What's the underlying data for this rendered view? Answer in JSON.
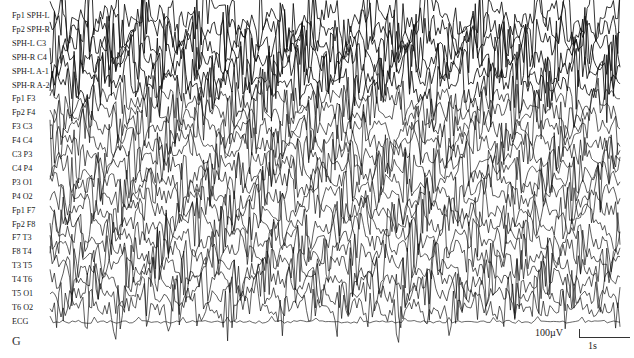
{
  "figure": {
    "panel_letter": "G",
    "channels": [
      "Fp1 SPH-L",
      "Fp2 SPH-R",
      "SPH-L C3",
      "SPH-R C4",
      "SPH-L A-1",
      "SPH-R A-2",
      "Fp1 F3",
      "Fp2 F4",
      "F3 C3",
      "F4 C4",
      "C3 P3",
      "C4 P4",
      "P3 O1",
      "P4 O2",
      "Fp1 F7",
      "Fp2 F8",
      "F7 T3",
      "F8 T4",
      "T3 T5",
      "T4 T6",
      "T5 O1",
      "T6 O2",
      "ECG"
    ],
    "scale_bar": {
      "amplitude_label": "100µV",
      "time_label": "1s"
    },
    "trace_color": "#111111"
  }
}
